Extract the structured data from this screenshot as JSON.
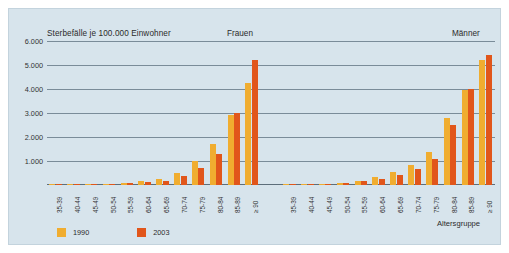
{
  "chart_data": {
    "type": "bar",
    "title": "Sterbefälle je 100.000 Einwohner",
    "xlabel": "Altersgruppe",
    "ylabel": "",
    "ylim": [
      0,
      6000
    ],
    "yticks": [
      1000,
      2000,
      3000,
      4000,
      5000,
      6000
    ],
    "ytick_labels": [
      "1.000",
      "2.000",
      "3.000",
      "4.000",
      "5.000",
      "6.000"
    ],
    "grid": true,
    "legend_position": "bottom-left",
    "categories": [
      "35-39",
      "40-44",
      "45-49",
      "50-54",
      "55-59",
      "60-64",
      "65-69",
      "70-74",
      "75-79",
      "80-84",
      "85-89",
      "≥ 90"
    ],
    "panels": [
      {
        "name": "frauen",
        "label": "Frauen",
        "series": [
          {
            "name": "1990",
            "color": "#f0ad30",
            "values": [
              12,
              20,
              33,
              55,
              95,
              150,
              235,
              490,
              1000,
              1710,
              2900,
              4250
            ]
          },
          {
            "name": "2003",
            "color": "#e1561b",
            "values": [
              10,
              16,
              26,
              42,
              72,
              115,
              175,
              360,
              700,
              1280,
              3000,
              5200
            ]
          }
        ]
      },
      {
        "name": "maenner",
        "label": "Männer",
        "series": [
          {
            "name": "1990",
            "color": "#f0ad30",
            "values": [
              18,
              28,
              50,
              100,
              185,
              330,
              540,
              830,
              1380,
              2800,
              3950,
              5200
            ]
          },
          {
            "name": "2003",
            "color": "#e1561b",
            "values": [
              14,
              22,
              40,
              80,
              150,
              255,
              420,
              660,
              1080,
              2480,
              4000,
              5400
            ]
          }
        ]
      }
    ]
  },
  "legend": {
    "items": [
      {
        "label": "1990",
        "color": "#f0ad30"
      },
      {
        "label": "2003",
        "color": "#e1561b"
      }
    ]
  },
  "colors": {
    "background": "#d7e4ec",
    "gridline": "#7a8c99",
    "series_1990": "#f0ad30",
    "series_2003": "#e1561b"
  }
}
